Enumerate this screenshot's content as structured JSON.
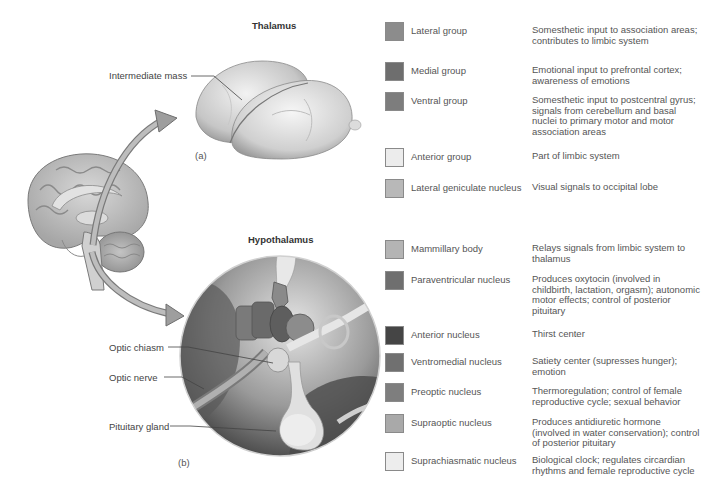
{
  "figure": {
    "thalamus": {
      "title": "Thalamus",
      "panel_label": "(a)",
      "callouts": [
        {
          "label": "Intermediate mass"
        }
      ]
    },
    "hypothalamus": {
      "title": "Hypothalamus",
      "panel_label": "(b)",
      "callouts": [
        {
          "label": "Optic chiasm"
        },
        {
          "label": "Optic nerve"
        },
        {
          "label": "Pituitary gland"
        }
      ]
    }
  },
  "legend": {
    "thalamus_items": [
      {
        "name": "Lateral group",
        "description": "Somesthetic input to association areas; contributes to limbic system",
        "color": "#8c8c8c"
      },
      {
        "name": "Medial group",
        "description": "Emotional input to prefrontal cortex; awareness of emotions",
        "color": "#6e6e6e"
      },
      {
        "name": "Ventral group",
        "description": "Somesthetic input to postcentral gyrus; signals from cerebellum and basal nuclei to primary motor and motor association areas",
        "color": "#7d7d7d"
      },
      {
        "name": "Anterior group",
        "description": "Part of limbic system",
        "color": "#ececec"
      },
      {
        "name": "Lateral geniculate nucleus",
        "description": "Visual signals to occipital lobe",
        "color": "#b8b8b8"
      }
    ],
    "hypothalamus_items": [
      {
        "name": "Mammillary body",
        "description": "Relays signals from limbic system to thalamus",
        "color": "#b4b4b4"
      },
      {
        "name": "Paraventricular nucleus",
        "description": "Produces oxytocin (involved in childbirth, lactation, orgasm); autonomic motor effects; control of posterior pituitary",
        "color": "#6f6f6f"
      },
      {
        "name": "Anterior nucleus",
        "description": "Thirst center",
        "color": "#454545"
      },
      {
        "name": "Ventromedial nucleus",
        "description": "Satiety center (supresses hunger); emotion",
        "color": "#707070"
      },
      {
        "name": "Preoptic nucleus",
        "description": "Thermoregulation; control of female reproductive cycle; sexual behavior",
        "color": "#7e7e7e"
      },
      {
        "name": "Supraoptic nucleus",
        "description": "Produces antidiuretic hormone (involved in water conservation); control of posterior pituitary",
        "color": "#a9a9a9"
      },
      {
        "name": "Suprachiasmatic nucleus",
        "description": "Biological clock; regulates circardian rhythms and female reproductive cycle",
        "color": "#ededed"
      }
    ]
  }
}
